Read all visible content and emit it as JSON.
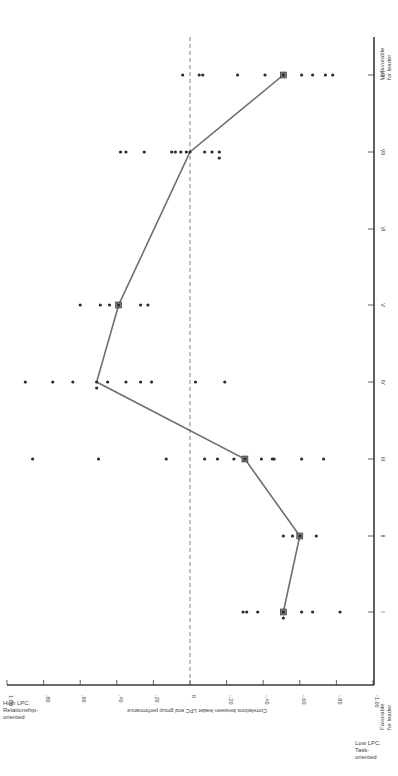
{
  "chart_data": {
    "type": "scatter",
    "title": "",
    "orientation": "rotated 90° (octants run bottom-to-top, correlation axis runs horizontally)",
    "xlabel": "Octant (situational favorableness)",
    "ylabel": "Correlations between leader LPC and group performance",
    "ylim": [
      -1.0,
      1.0
    ],
    "y_ticks": [
      "1.00",
      ".80",
      ".60",
      ".40",
      ".20",
      "0",
      "-.20",
      "-.40",
      "-.60",
      "-.80",
      "-1.00"
    ],
    "categories": [
      "I",
      "II",
      "III",
      "IV",
      "V",
      "VI",
      "VII",
      "VIII"
    ],
    "x_end_labels": {
      "start": "Favorable for leader",
      "end": "Unfavorable for leader"
    },
    "y_end_labels": {
      "high": "High LPC: Relationship-oriented",
      "low": "Low LPC: Task-oriented"
    },
    "reference_line": {
      "value": 0,
      "style": "dashed"
    },
    "series": [
      {
        "name": "Individual study correlations",
        "marker": "dot",
        "points": {
          "I": [
            -0.29,
            -0.31,
            -0.37,
            -0.51,
            -0.51,
            -0.61,
            -0.67,
            -0.82
          ],
          "II": [
            -0.51,
            -0.56,
            -0.6,
            -0.69
          ],
          "III": [
            0.86,
            0.5,
            0.13,
            -0.08,
            -0.15,
            -0.24,
            -0.3,
            -0.39,
            -0.45,
            -0.46,
            -0.61,
            -0.73
          ],
          "IV": [
            0.9,
            0.75,
            0.64,
            0.51,
            0.51,
            0.45,
            0.35,
            0.27,
            0.21,
            -0.03,
            -0.19
          ],
          "V": [
            0.6,
            0.49,
            0.44,
            0.39,
            0.27,
            0.23
          ],
          "VI": [],
          "VII": [
            0.38,
            0.35,
            0.25,
            0.1,
            0.08,
            0.05,
            0.02,
            0.0,
            -0.08,
            -0.12,
            -0.16,
            -0.16
          ],
          "VIII": [
            0.04,
            -0.05,
            -0.07,
            -0.26,
            -0.41,
            -0.51,
            -0.61,
            -0.67,
            -0.74,
            -0.78
          ]
        }
      },
      {
        "name": "Median correlation",
        "marker": "square",
        "line": true,
        "values": {
          "I": -0.51,
          "II": -0.6,
          "III": -0.3,
          "IV": 0.51,
          "V": 0.39,
          "VII": 0.0,
          "VIII": -0.51
        }
      }
    ]
  },
  "labels": {
    "ylabel": "Correlations between leader LPC and group performance",
    "high_lpc": "High LPC:\nRelationship-\noriented",
    "low_lpc": "Low LPC:\nTask-\noriented",
    "favorable": "Favorable\nfor leader",
    "unfavorable": "Unfavorable\nfor leader"
  },
  "colors": {
    "axis": "#3a3a3a",
    "dot": "#2b2b2b",
    "line": "#6e6e6e",
    "square_fill": "#7a7a7a"
  }
}
